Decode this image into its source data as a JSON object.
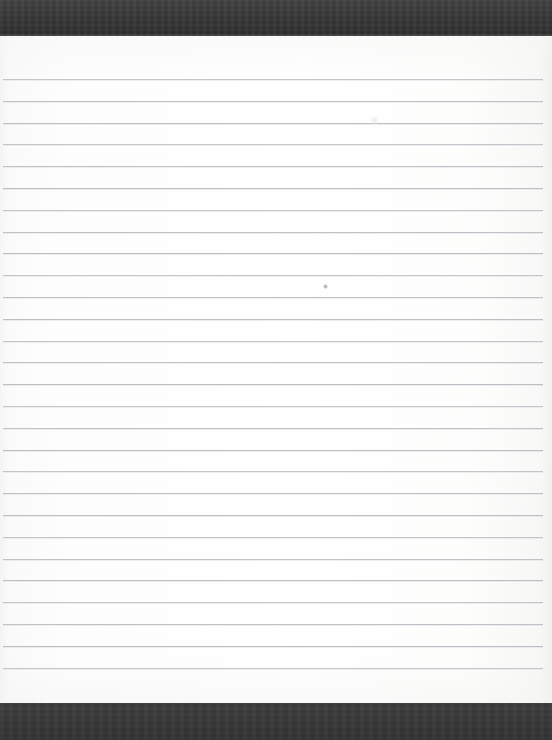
{
  "document": {
    "kind": "scanned-blank-lined-notepad-page",
    "visible_text": "",
    "page_width": 552,
    "page_height": 740,
    "colors": {
      "scanner_band": "#3b3b3b",
      "paper": "#fdfdfc",
      "rule_line": "#b6babd"
    }
  },
  "bands": {
    "top": {
      "y": 0,
      "height": 36
    },
    "bottom": {
      "y": 703,
      "height": 37
    }
  },
  "paper": {
    "y": 36,
    "height": 667,
    "left_edge": 0,
    "right_edge": 552
  },
  "ruling": {
    "line_count": 28,
    "first_line_y": 79,
    "spacing": 21.8,
    "line_left_x": 3,
    "line_right_x": 543,
    "line_thickness": 1,
    "lines_y": [
      79,
      100.8,
      122.6,
      144.4,
      166.2,
      188,
      209.8,
      231.6,
      253.4,
      275.2,
      297,
      318.8,
      340.6,
      362.4,
      384.2,
      406,
      427.8,
      449.6,
      471.4,
      493.2,
      515,
      536.8,
      558.6,
      580.4,
      602.2,
      624,
      645.8,
      667.6
    ],
    "lines_width": [
      540,
      540,
      540,
      540,
      540,
      540,
      540,
      540,
      540,
      540,
      540,
      540,
      540,
      540,
      540,
      540,
      540,
      540,
      540,
      540,
      540,
      540,
      540,
      540,
      540,
      540,
      540,
      540
    ]
  },
  "artifacts": [
    {
      "name": "faint-light-smudge",
      "x": 374,
      "y": 120,
      "size": 9,
      "tone": "light"
    },
    {
      "name": "faint-dark-speck",
      "x": 325,
      "y": 286,
      "size": 5,
      "tone": "dark"
    }
  ]
}
